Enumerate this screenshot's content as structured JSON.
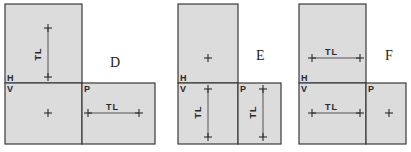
{
  "colors": {
    "fill": "#dcdcdc",
    "stroke": "#3a3a3a",
    "text": "#2a2a2a"
  },
  "panels": [
    {
      "letter": "D",
      "letter_pos": [
        110,
        67
      ],
      "boxes": [
        {
          "name": "horizontal-plane",
          "x": 5,
          "y": 4,
          "w": 77,
          "h": 79
        },
        {
          "name": "vertical-plane",
          "x": 5,
          "y": 83,
          "w": 77,
          "h": 61
        },
        {
          "name": "profile-plane",
          "x": 82,
          "y": 83,
          "w": 73,
          "h": 61
        }
      ],
      "labels": {
        "H": "H",
        "V": "V",
        "P": "P",
        "TL": "TL"
      },
      "crosses": [
        [
          48,
          28
        ],
        [
          48,
          77
        ],
        [
          48,
          113
        ],
        [
          88,
          113
        ],
        [
          139,
          113
        ]
      ],
      "tl_lines": [
        {
          "x1": 48,
          "y1": 28,
          "x2": 48,
          "y2": 77,
          "vertical": true,
          "lx": 41,
          "ly": 54
        },
        {
          "x1": 88,
          "y1": 113,
          "x2": 139,
          "y2": 113,
          "vertical": false,
          "lx": 106,
          "ly": 110
        }
      ]
    },
    {
      "letter": "E",
      "letter_pos": [
        256,
        60
      ],
      "boxes": [
        {
          "name": "horizontal-plane",
          "x": 178,
          "y": 4,
          "w": 60,
          "h": 79
        },
        {
          "name": "vertical-plane",
          "x": 178,
          "y": 83,
          "w": 60,
          "h": 61
        },
        {
          "name": "profile-plane",
          "x": 238,
          "y": 83,
          "w": 43,
          "h": 61
        }
      ],
      "labels": {
        "H": "H",
        "V": "V",
        "P": "P",
        "TL": "TL"
      },
      "crosses": [
        [
          208,
          58
        ],
        [
          208,
          89
        ],
        [
          208,
          137
        ],
        [
          263,
          89
        ],
        [
          263,
          137
        ]
      ],
      "tl_lines": [
        {
          "x1": 208,
          "y1": 89,
          "x2": 208,
          "y2": 137,
          "vertical": true,
          "lx": 201,
          "ly": 112
        },
        {
          "x1": 263,
          "y1": 89,
          "x2": 263,
          "y2": 137,
          "vertical": true,
          "lx": 256,
          "ly": 112
        }
      ]
    },
    {
      "letter": "F",
      "letter_pos": [
        385,
        60
      ],
      "boxes": [
        {
          "name": "horizontal-plane",
          "x": 299,
          "y": 4,
          "w": 67,
          "h": 79
        },
        {
          "name": "vertical-plane",
          "x": 299,
          "y": 83,
          "w": 67,
          "h": 61
        },
        {
          "name": "profile-plane",
          "x": 366,
          "y": 83,
          "w": 40,
          "h": 61
        }
      ],
      "labels": {
        "H": "H",
        "V": "V",
        "P": "P",
        "TL": "TL"
      },
      "crosses": [
        [
          312,
          58
        ],
        [
          360,
          58
        ],
        [
          312,
          113
        ],
        [
          360,
          113
        ],
        [
          389,
          113
        ]
      ],
      "tl_lines": [
        {
          "x1": 312,
          "y1": 58,
          "x2": 360,
          "y2": 58,
          "vertical": false,
          "lx": 325,
          "ly": 55
        },
        {
          "x1": 312,
          "y1": 113,
          "x2": 360,
          "y2": 113,
          "vertical": false,
          "lx": 325,
          "ly": 110
        }
      ]
    }
  ]
}
